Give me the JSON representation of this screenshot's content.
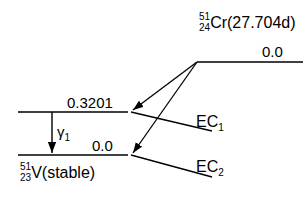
{
  "diagram": {
    "type": "nuclear-decay-scheme",
    "parent": {
      "mass_number": "51",
      "atomic_number": "24",
      "symbol": "Cr",
      "detail": "(27.704d)",
      "level_energy": "0.0"
    },
    "daughter": {
      "mass_number": "51",
      "atomic_number": "23",
      "symbol": "V",
      "detail": "(stable)",
      "excited_level_energy": "0.3201",
      "ground_level_energy": "0.0"
    },
    "transitions": {
      "gamma": {
        "label": "γ",
        "index": "1"
      },
      "ec1": {
        "label": "EC",
        "index": "1"
      },
      "ec2": {
        "label": "EC",
        "index": "2"
      }
    },
    "colors": {
      "line": "#000000",
      "background": "#ffffff"
    }
  }
}
